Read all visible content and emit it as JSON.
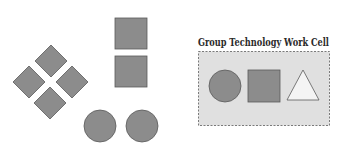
{
  "diagram": {
    "title": "Group Technology Work Cell",
    "colors": {
      "shape_fill": "#8c8c8c",
      "shape_stroke": "#5a5a5a",
      "cell_fill": "#e0e0e0",
      "cell_border": "#7a7a7a",
      "triangle_fill": "#f4f4f4",
      "title_color": "#2a2a2a"
    },
    "ungrouped_parts": {
      "diamonds": 4,
      "squares": 2,
      "circles": 2
    },
    "work_cell": {
      "label": "Group Technology Work Cell",
      "shapes": [
        "circle",
        "square",
        "triangle"
      ]
    }
  }
}
